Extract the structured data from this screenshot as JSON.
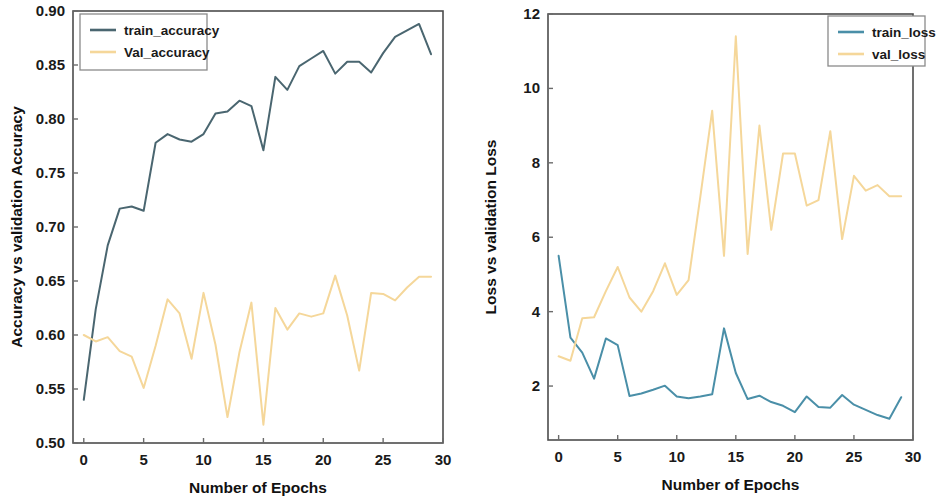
{
  "figure": {
    "background": "#ffffff",
    "panel_count": 2
  },
  "chart_data": [
    {
      "id": "accuracy",
      "type": "line",
      "title": "",
      "xlabel": "Number of Epochs",
      "ylabel": "Accuracy vs validation Accuracy",
      "xlim": [
        -0.9,
        30.0
      ],
      "ylim": [
        0.5,
        0.9
      ],
      "xticks": [
        0,
        5,
        10,
        15,
        20,
        25,
        30
      ],
      "xticklabels": [
        "0",
        "5",
        "10",
        "15",
        "20",
        "25",
        "30"
      ],
      "yticks": [
        0.5,
        0.55,
        0.6,
        0.65,
        0.7,
        0.75,
        0.8,
        0.85,
        0.9
      ],
      "yticklabels": [
        "0.50",
        "0.55",
        "0.60",
        "0.65",
        "0.70",
        "0.75",
        "0.80",
        "0.85",
        "0.90"
      ],
      "grid": false,
      "legend_position": "upper left",
      "x": [
        0,
        1,
        2,
        3,
        4,
        5,
        6,
        7,
        8,
        9,
        10,
        11,
        12,
        13,
        14,
        15,
        16,
        17,
        18,
        19,
        20,
        21,
        22,
        23,
        24,
        25,
        26,
        27,
        28,
        29
      ],
      "series": [
        {
          "name": "train_accuracy",
          "color": "#4a6670",
          "values": [
            0.54,
            0.624,
            0.683,
            0.717,
            0.719,
            0.715,
            0.778,
            0.786,
            0.781,
            0.779,
            0.786,
            0.805,
            0.807,
            0.817,
            0.812,
            0.771,
            0.839,
            0.827,
            0.849,
            0.856,
            0.863,
            0.842,
            0.853,
            0.853,
            0.843,
            0.861,
            0.876,
            0.882,
            0.888,
            0.86
          ]
        },
        {
          "name": "Val_accuracy",
          "color": "#f5d79a",
          "values": [
            0.6,
            0.594,
            0.598,
            0.585,
            0.58,
            0.551,
            0.59,
            0.633,
            0.62,
            0.578,
            0.639,
            0.591,
            0.524,
            0.584,
            0.63,
            0.517,
            0.625,
            0.605,
            0.62,
            0.617,
            0.62,
            0.655,
            0.618,
            0.567,
            0.639,
            0.638,
            0.632,
            0.644,
            0.654,
            0.654
          ]
        }
      ]
    },
    {
      "id": "loss",
      "type": "line",
      "title": "",
      "xlabel": "Number of Epochs",
      "ylabel": "Loss vs validation Loss",
      "xlim": [
        -0.9,
        30.0
      ],
      "ylim": [
        0.55,
        12.0
      ],
      "xticks": [
        0,
        5,
        10,
        15,
        20,
        25,
        30
      ],
      "xticklabels": [
        "0",
        "5",
        "10",
        "15",
        "20",
        "25",
        "30"
      ],
      "yticks": [
        2,
        4,
        6,
        8,
        10,
        12
      ],
      "yticklabels": [
        "2",
        "4",
        "6",
        "8",
        "10",
        "12"
      ],
      "grid": false,
      "legend_position": "upper right",
      "x": [
        0,
        1,
        2,
        3,
        4,
        5,
        6,
        7,
        8,
        9,
        10,
        11,
        12,
        13,
        14,
        15,
        16,
        17,
        18,
        19,
        20,
        21,
        22,
        23,
        24,
        25,
        26,
        27,
        28,
        29
      ],
      "series": [
        {
          "name": "train_loss",
          "color": "#4a8fa8",
          "values": [
            5.5,
            3.3,
            2.9,
            2.2,
            3.28,
            3.1,
            1.73,
            1.8,
            1.9,
            2.01,
            1.72,
            1.67,
            1.72,
            1.78,
            3.55,
            2.35,
            1.65,
            1.74,
            1.57,
            1.47,
            1.3,
            1.72,
            1.44,
            1.42,
            1.76,
            1.5,
            1.36,
            1.22,
            1.12,
            1.7
          ]
        },
        {
          "name": "val_loss",
          "color": "#f5d79a",
          "values": [
            2.8,
            2.68,
            3.82,
            3.85,
            4.55,
            5.2,
            4.38,
            4.0,
            4.55,
            5.3,
            4.45,
            4.85,
            7.1,
            9.4,
            5.5,
            11.4,
            5.55,
            9.0,
            6.2,
            8.25,
            8.25,
            6.85,
            7.0,
            8.85,
            5.95,
            7.65,
            7.25,
            7.4,
            7.1,
            7.1
          ]
        }
      ]
    }
  ]
}
